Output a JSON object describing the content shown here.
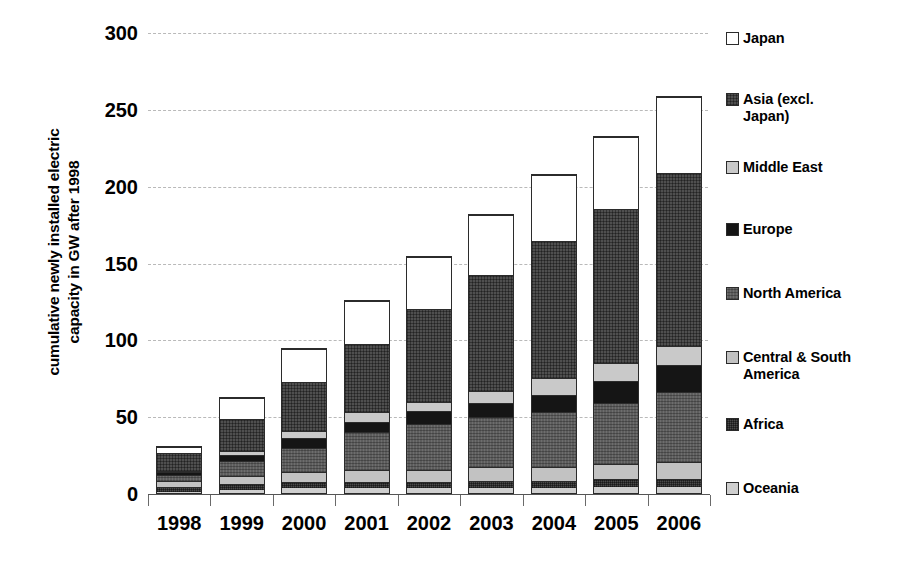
{
  "chart_data": {
    "type": "bar",
    "stacked": true,
    "title": "",
    "xlabel": "",
    "ylabel": "cumulative newly installed electric capacity in GW after 1998",
    "ylabel_lines": [
      "cumulative newly installed electric",
      "capacity in GW after 1998"
    ],
    "categories": [
      "1998",
      "1999",
      "2000",
      "2001",
      "2002",
      "2003",
      "2004",
      "2005",
      "2006"
    ],
    "ylim": [
      0,
      300
    ],
    "yticks": [
      0,
      50,
      100,
      150,
      200,
      250,
      300
    ],
    "ytick_labels": [
      "0",
      "50",
      "100",
      "150",
      "200",
      "250",
      "300"
    ],
    "grid": true,
    "grid_style": "dashed horizontal",
    "legend_position": "right",
    "series": [
      {
        "name": "Oceania",
        "color": "#cfcfcf",
        "values": [
          1,
          2,
          3,
          3,
          3,
          3,
          3,
          4,
          4
        ]
      },
      {
        "name": "Africa",
        "color": "#4a4a4a",
        "values": [
          3,
          4,
          4,
          4,
          4,
          5,
          5,
          5,
          5
        ]
      },
      {
        "name": "Central & South America",
        "color": "#c2c2c2",
        "values": [
          4,
          5,
          7,
          8,
          8,
          9,
          9,
          10,
          11
        ]
      },
      {
        "name": "North America",
        "color": "#5d5d5d",
        "values": [
          4,
          10,
          16,
          25,
          30,
          33,
          36,
          40,
          46
        ]
      },
      {
        "name": "Europe",
        "color": "#151515",
        "values": [
          2,
          4,
          6,
          7,
          9,
          9,
          11,
          14,
          18
        ]
      },
      {
        "name": "Middle East",
        "color": "#c9c9c9",
        "values": [
          1,
          3,
          5,
          6,
          6,
          8,
          11,
          12,
          12
        ]
      },
      {
        "name": "Asia (excl. Japan)",
        "color": "#4f4f4f",
        "values": [
          12,
          21,
          32,
          45,
          61,
          76,
          90,
          101,
          113
        ]
      },
      {
        "name": "Japan",
        "color": "#ffffff",
        "values": [
          4,
          14,
          22,
          28,
          34,
          39,
          43,
          47,
          50
        ]
      }
    ],
    "totals": [
      31,
      63,
      95,
      126,
      155,
      182,
      208,
      233,
      259
    ]
  },
  "legend": {
    "items": [
      {
        "label": "Japan",
        "swatch": "f-japan",
        "top": 0
      },
      {
        "label": "Asia (excl.\nJapan)",
        "swatch": "f-asia",
        "top": 61
      },
      {
        "label": "Middle East",
        "swatch": "f-middleeast",
        "top": 129
      },
      {
        "label": "Europe",
        "swatch": "f-europe",
        "top": 191
      },
      {
        "label": "North America",
        "swatch": "f-northamerica",
        "top": 255
      },
      {
        "label": "Central & South\nAmerica",
        "swatch": "f-csamerica",
        "top": 319
      },
      {
        "label": "Africa",
        "swatch": "f-africa",
        "top": 386
      },
      {
        "label": "Oceania",
        "swatch": "f-oceania",
        "top": 450
      }
    ]
  }
}
